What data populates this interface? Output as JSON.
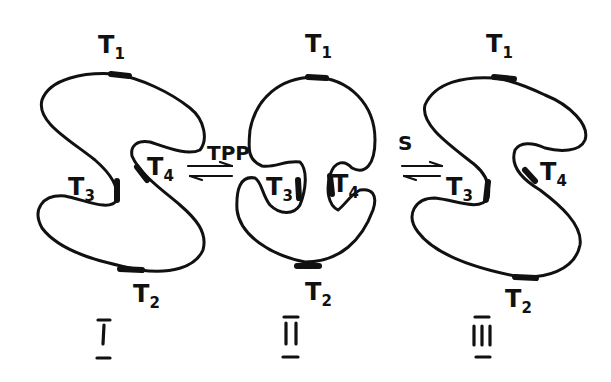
{
  "diagram": {
    "type": "conformational-equilibrium",
    "states": [
      {
        "id": "I",
        "roman_label": "I",
        "sites": {
          "top": "T",
          "top_sub": "1",
          "bottom": "T",
          "bottom_sub": "2",
          "left": "T",
          "left_sub": "3",
          "right": "T",
          "right_sub": "4"
        }
      },
      {
        "id": "II",
        "roman_label": "II",
        "sites": {
          "top": "T",
          "top_sub": "1",
          "bottom": "T",
          "bottom_sub": "2",
          "left": "T",
          "left_sub": "3",
          "right": "T",
          "right_sub": "4"
        }
      },
      {
        "id": "III",
        "roman_label": "III",
        "sites": {
          "top": "T",
          "top_sub": "1",
          "bottom": "T",
          "bottom_sub": "2",
          "left": "T",
          "left_sub": "3",
          "right": "T",
          "right_sub": "4"
        }
      }
    ],
    "equilibria": [
      {
        "from": "I",
        "to": "II",
        "label": "TPP"
      },
      {
        "from": "II",
        "to": "III",
        "label": "S"
      }
    ],
    "colors": {
      "ink": "#111111",
      "background": "#ffffff"
    }
  }
}
